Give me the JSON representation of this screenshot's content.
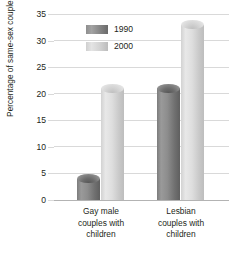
{
  "chart_data": {
    "type": "bar",
    "title": "",
    "subtitle": "",
    "xlabel": "",
    "ylabel": "Percentage of same-sex couples",
    "categories": [
      "Gay male couples with children",
      "Lesbian couples with children"
    ],
    "category_lines": [
      [
        "Gay male",
        "couples with",
        "children"
      ],
      [
        "Lesbian",
        "couples with",
        "children"
      ]
    ],
    "series": [
      {
        "name": "1990",
        "values": [
          4,
          21
        ],
        "color": "#8a8a8a"
      },
      {
        "name": "2000",
        "values": [
          21,
          33
        ],
        "color": "#d8d8d8"
      }
    ],
    "ylim": [
      0,
      35
    ],
    "yticks": [
      0,
      5,
      10,
      15,
      20,
      25,
      30,
      35
    ],
    "ytick_labels": [
      "0",
      "5",
      "10",
      "15",
      "20",
      "25",
      "30",
      "35"
    ],
    "grid": true,
    "legend_position": "upper-left-inside",
    "style": "3d-cylinder"
  },
  "legend": {
    "items": [
      {
        "label": "1990",
        "swatch": "dark-gray-swatch"
      },
      {
        "label": "2000",
        "swatch": "light-gray-swatch"
      }
    ]
  },
  "axis": {
    "y_title": "Percentage of same-sex couples"
  }
}
